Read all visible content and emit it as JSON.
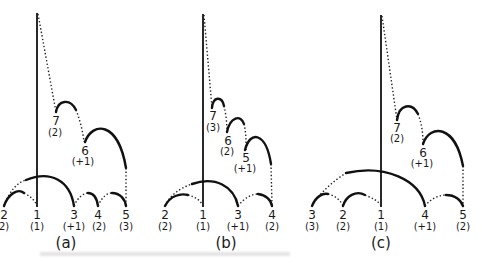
{
  "figure": {
    "panels": [
      {
        "caption": "(a)",
        "bottom_nodes": [
          {
            "id": "2",
            "value": "2)"
          },
          {
            "id": "1",
            "value": "(1)"
          },
          {
            "id": "3",
            "value": "(+1)"
          },
          {
            "id": "4",
            "value": "(2)"
          },
          {
            "id": "5",
            "value": "(3)"
          }
        ],
        "upper_nodes": [
          {
            "id": "7",
            "value": "(2)"
          },
          {
            "id": "6",
            "value": "(+1)"
          }
        ]
      },
      {
        "caption": "(b)",
        "bottom_nodes": [
          {
            "id": "2",
            "value": "(2)"
          },
          {
            "id": "1",
            "value": "(1)"
          },
          {
            "id": "3",
            "value": "(+1)"
          },
          {
            "id": "4",
            "value": "(2)"
          }
        ],
        "upper_nodes": [
          {
            "id": "7",
            "value": "(3)"
          },
          {
            "id": "6",
            "value": "(2)"
          },
          {
            "id": "5",
            "value": "(+1)"
          }
        ]
      },
      {
        "caption": "(c)",
        "bottom_nodes": [
          {
            "id": "3",
            "value": "(3)"
          },
          {
            "id": "2",
            "value": "(2)"
          },
          {
            "id": "1",
            "value": "(1)"
          },
          {
            "id": "4",
            "value": "(+1)"
          },
          {
            "id": "5",
            "value": "(2)"
          }
        ],
        "upper_nodes": [
          {
            "id": "7",
            "value": "(2)"
          },
          {
            "id": "6",
            "value": "(+1)"
          }
        ]
      }
    ],
    "colors": {
      "ink": "#111111",
      "background": "#ffffff"
    }
  }
}
